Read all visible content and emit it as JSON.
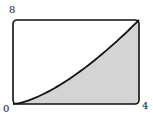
{
  "chart_data": {
    "type": "area",
    "title": "",
    "function": "y = x^(3/2)",
    "x": [
      0,
      0.5,
      1,
      1.5,
      2,
      2.5,
      3,
      3.5,
      4
    ],
    "y": [
      0,
      0.354,
      1,
      1.837,
      2.828,
      3.953,
      5.196,
      6.548,
      8
    ],
    "xlim": [
      0,
      4
    ],
    "ylim": [
      0,
      8
    ],
    "tick_labels": {
      "x_min": "0",
      "x_max": "4",
      "y_max": "8"
    },
    "shaded_region": "below curve",
    "grid": false,
    "colors": {
      "fill": "#d4d4d4",
      "stroke": "#111111"
    }
  }
}
